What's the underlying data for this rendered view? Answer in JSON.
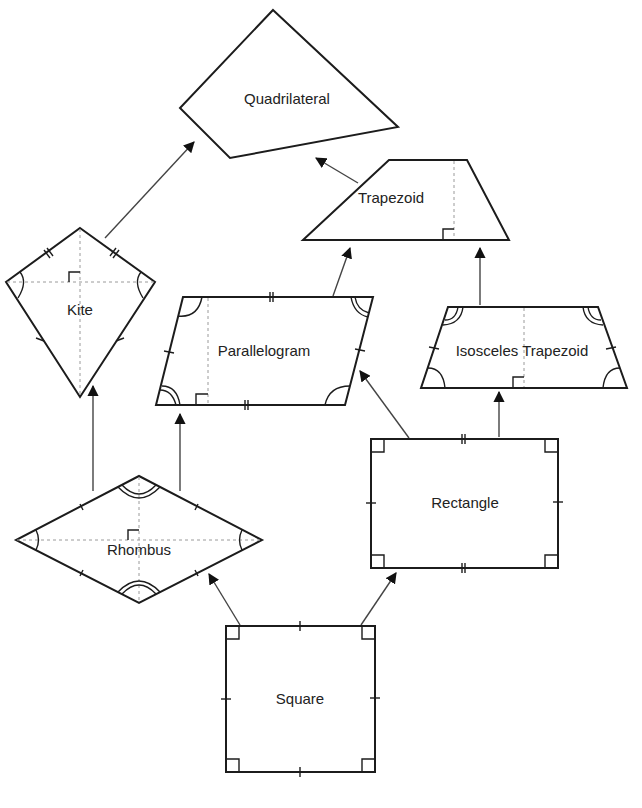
{
  "colors": {
    "stroke": "#1c1c1c",
    "arrow": "#444444",
    "dash": "#9a9a9a",
    "background": "#ffffff"
  },
  "nodes": {
    "quadrilateral": {
      "label": "Quadrilateral"
    },
    "trapezoid": {
      "label": "Trapezoid"
    },
    "kite": {
      "label": "Kite"
    },
    "parallelogram": {
      "label": "Parallelogram"
    },
    "isosceles_trapezoid": {
      "label": "Isosceles Trapezoid"
    },
    "rectangle": {
      "label": "Rectangle"
    },
    "rhombus": {
      "label": "Rhombus"
    },
    "square": {
      "label": "Square"
    }
  },
  "edges": [
    {
      "from": "trapezoid",
      "to": "quadrilateral"
    },
    {
      "from": "kite",
      "to": "quadrilateral"
    },
    {
      "from": "parallelogram",
      "to": "trapezoid"
    },
    {
      "from": "isosceles_trapezoid",
      "to": "trapezoid"
    },
    {
      "from": "rhombus",
      "to": "kite"
    },
    {
      "from": "rhombus",
      "to": "parallelogram"
    },
    {
      "from": "rectangle",
      "to": "parallelogram"
    },
    {
      "from": "rectangle",
      "to": "isosceles_trapezoid"
    },
    {
      "from": "square",
      "to": "rhombus"
    },
    {
      "from": "square",
      "to": "rectangle"
    }
  ]
}
